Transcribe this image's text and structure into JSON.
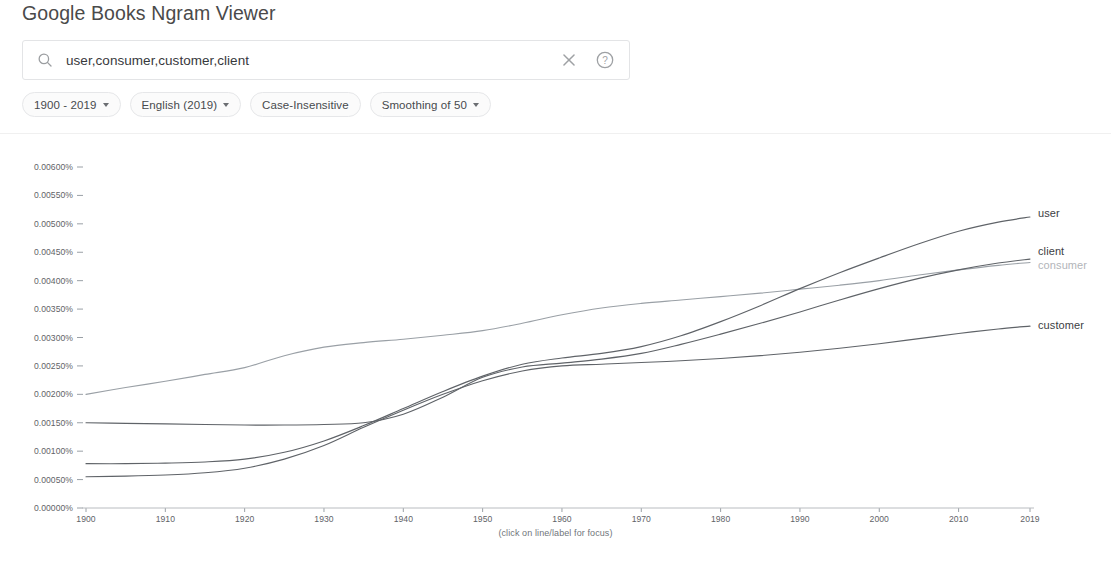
{
  "header": {
    "title": "Google Books Ngram Viewer"
  },
  "search": {
    "value": "user,consumer,customer,client",
    "placeholder": "Search in Google Books Ngram Viewer",
    "search_icon": "search-icon",
    "clear_icon": "close-icon",
    "help_icon": "help-circle-icon"
  },
  "controls": {
    "chips": [
      {
        "label": "1900 - 2019",
        "has_caret": true,
        "name": "year-range-chip"
      },
      {
        "label": "English (2019)",
        "has_caret": true,
        "name": "corpus-chip"
      },
      {
        "label": "Case-Insensitive",
        "has_caret": false,
        "name": "case-insensitive-chip"
      },
      {
        "label": "Smoothing of 50",
        "has_caret": true,
        "name": "smoothing-chip"
      }
    ]
  },
  "chart_caption": "(click on line/label for focus)",
  "chart_data": {
    "type": "line",
    "title": "",
    "xlabel": "",
    "ylabel": "",
    "grid": false,
    "legend_position": "right-inline",
    "xlim": [
      1900,
      2019
    ],
    "ylim": [
      0.0,
      0.006
    ],
    "xticks": [
      1900,
      1910,
      1920,
      1930,
      1940,
      1950,
      1960,
      1970,
      1980,
      1990,
      2000,
      2010,
      2019
    ],
    "xticklabels": [
      "1900",
      "1910",
      "1920",
      "1930",
      "1940",
      "1950",
      "1960",
      "1970",
      "1980",
      "1990",
      "2000",
      "2010",
      "2019"
    ],
    "yticks": [
      0.0,
      0.0005,
      0.001,
      0.0015,
      0.002,
      0.0025,
      0.003,
      0.0035,
      0.004,
      0.0045,
      0.005,
      0.0055,
      0.006
    ],
    "yticklabels": [
      "0.00000%",
      "0.00050%",
      "0.00100%",
      "0.00150%",
      "0.00200%",
      "0.00250%",
      "0.00300%",
      "0.00350%",
      "0.00400%",
      "0.00450%",
      "0.00500%",
      "0.00550%",
      "0.00600%"
    ],
    "x": [
      1900,
      1905,
      1910,
      1915,
      1920,
      1925,
      1930,
      1935,
      1940,
      1945,
      1950,
      1955,
      1960,
      1965,
      1970,
      1975,
      1980,
      1985,
      1990,
      1995,
      2000,
      2005,
      2010,
      2015,
      2019
    ],
    "series": [
      {
        "name": "consumer",
        "color": "#9aa0a6",
        "label_style": "dim",
        "values": [
          0.002,
          0.00212,
          0.00223,
          0.00235,
          0.00247,
          0.00268,
          0.00283,
          0.00291,
          0.00297,
          0.00304,
          0.00312,
          0.00325,
          0.0034,
          0.00352,
          0.0036,
          0.00366,
          0.00372,
          0.00378,
          0.00385,
          0.00392,
          0.004,
          0.0041,
          0.00419,
          0.00427,
          0.00432
        ]
      },
      {
        "name": "client",
        "color": "#5f6368",
        "label_style": "normal",
        "values": [
          0.0015,
          0.00149,
          0.00148,
          0.00147,
          0.00146,
          0.00146,
          0.00147,
          0.0015,
          0.00165,
          0.00195,
          0.0023,
          0.00248,
          0.00255,
          0.00262,
          0.00272,
          0.00288,
          0.00306,
          0.00325,
          0.00345,
          0.00366,
          0.00386,
          0.00404,
          0.00419,
          0.00431,
          0.00438
        ]
      },
      {
        "name": "user",
        "color": "#5f6368",
        "label_style": "normal",
        "values": [
          0.00078,
          0.00078,
          0.00079,
          0.00081,
          0.00086,
          0.00098,
          0.00118,
          0.00145,
          0.00175,
          0.00205,
          0.00232,
          0.00253,
          0.00264,
          0.00272,
          0.00284,
          0.00303,
          0.00328,
          0.00356,
          0.00386,
          0.00414,
          0.0044,
          0.00465,
          0.00487,
          0.00503,
          0.00512
        ]
      },
      {
        "name": "customer",
        "color": "#5f6368",
        "label_style": "normal",
        "values": [
          0.00055,
          0.00056,
          0.00058,
          0.00062,
          0.0007,
          0.00086,
          0.0011,
          0.00142,
          0.00172,
          0.002,
          0.00224,
          0.00241,
          0.0025,
          0.00253,
          0.00256,
          0.00259,
          0.00263,
          0.00268,
          0.00274,
          0.00281,
          0.00289,
          0.00298,
          0.00307,
          0.00315,
          0.0032
        ]
      }
    ]
  }
}
